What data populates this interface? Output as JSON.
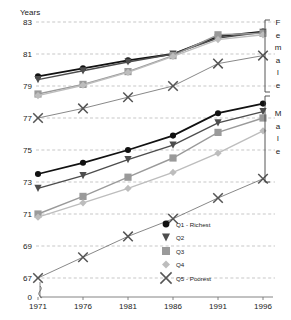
{
  "chart_data": {
    "type": "line",
    "title": "",
    "ylabel": "Years",
    "xlabel": "",
    "x": [
      1971,
      1976,
      1981,
      1986,
      1991,
      1996
    ],
    "xtick_labels": [
      "1971",
      "1976",
      "1981",
      "1986",
      "1991",
      "1996"
    ],
    "ytick_labels": [
      "0",
      "67",
      "69",
      "71",
      "73",
      "75",
      "77",
      "79",
      "81",
      "83"
    ],
    "ylim": [
      67,
      83
    ],
    "axis_break": true,
    "grid": true,
    "legend_position": "inside-lower-right",
    "groups": [
      {
        "name": "Female",
        "label": "Female",
        "series": [
          {
            "name": "Q1 - Richest",
            "marker": "circle",
            "color": "#111111",
            "values": [
              79.6,
              80.1,
              80.6,
              81.0,
              82.1,
              82.4
            ]
          },
          {
            "name": "Q2",
            "marker": "triangle-down",
            "color": "#4d4d4d",
            "values": [
              79.4,
              79.95,
              80.5,
              81.0,
              82.0,
              82.35
            ]
          },
          {
            "name": "Q3",
            "marker": "square",
            "color": "#9a9a9a",
            "values": [
              78.5,
              79.1,
              79.9,
              80.9,
              82.2,
              82.3
            ]
          },
          {
            "name": "Q4",
            "marker": "diamond",
            "color": "#bdbdbd",
            "values": [
              78.4,
              79.05,
              79.85,
              80.85,
              81.9,
              82.2
            ]
          },
          {
            "name": "Q5 - Poorest",
            "marker": "cross",
            "color": "#555555",
            "values": [
              77.0,
              77.6,
              78.3,
              79.0,
              80.4,
              80.9
            ]
          }
        ]
      },
      {
        "name": "Male",
        "label": "Male",
        "series": [
          {
            "name": "Q1 - Richest",
            "marker": "circle",
            "color": "#111111",
            "values": [
              73.5,
              74.2,
              75.0,
              75.9,
              77.3,
              77.9
            ]
          },
          {
            "name": "Q2",
            "marker": "triangle-down",
            "color": "#4d4d4d",
            "values": [
              72.6,
              73.4,
              74.4,
              75.3,
              76.7,
              77.4
            ]
          },
          {
            "name": "Q3",
            "marker": "square",
            "color": "#9a9a9a",
            "values": [
              71.0,
              72.1,
              73.3,
              74.5,
              76.1,
              77.0
            ]
          },
          {
            "name": "Q4",
            "marker": "diamond",
            "color": "#bdbdbd",
            "values": [
              70.8,
              71.7,
              72.6,
              73.6,
              74.8,
              76.2
            ]
          },
          {
            "name": "Q5 - Poorest",
            "marker": "cross",
            "color": "#555555",
            "values": [
              67.0,
              68.3,
              69.6,
              70.7,
              72.0,
              73.2
            ]
          }
        ]
      }
    ],
    "legend": [
      {
        "label": "Q1 - Richest",
        "marker": "circle",
        "color": "#111111"
      },
      {
        "label": "Q2",
        "marker": "triangle-down",
        "color": "#4d4d4d"
      },
      {
        "label": "Q3",
        "marker": "square",
        "color": "#9a9a9a"
      },
      {
        "label": "Q4",
        "marker": "diamond",
        "color": "#bdbdbd"
      },
      {
        "label": "Q5 - Poorest",
        "marker": "cross",
        "color": "#555555"
      }
    ],
    "side_labels": [
      {
        "text": "Female",
        "letters": [
          "F",
          "e",
          "m",
          "a",
          "l",
          "e"
        ]
      },
      {
        "text": "Male",
        "letters": [
          "M",
          "a",
          "l",
          "e"
        ]
      }
    ]
  }
}
